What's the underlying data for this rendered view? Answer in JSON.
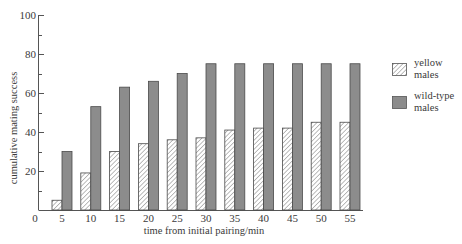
{
  "chart_data": {
    "type": "bar",
    "title": "",
    "xlabel": "time from initial pairing/min",
    "ylabel": "cumulative mating success",
    "categories": [
      "5",
      "10",
      "15",
      "20",
      "25",
      "30",
      "35",
      "40",
      "45",
      "50",
      "55"
    ],
    "series": [
      {
        "name": "yellow males",
        "pattern": "hatched",
        "values": [
          5,
          19,
          30,
          34,
          36,
          37,
          41,
          42,
          42,
          45,
          45
        ]
      },
      {
        "name": "wild-type males",
        "pattern": "solid-gray",
        "values": [
          30,
          53,
          63,
          66,
          70,
          75,
          75,
          75,
          75,
          75,
          75
        ]
      }
    ],
    "ylim": [
      0,
      100
    ],
    "yticks": [
      0,
      20,
      40,
      60,
      80,
      100
    ],
    "grid": false,
    "legend_position": "right"
  },
  "axes": {
    "x_origin_label": "0",
    "y_tick_labels": [
      "20",
      "40",
      "60",
      "80",
      "100"
    ]
  },
  "legend": [
    {
      "line1": "yellow",
      "line2": "males"
    },
    {
      "line1": "wild-type",
      "line2": "males"
    }
  ],
  "colors": {
    "wild_type_fill": "#8c8c8c",
    "bar_outline": "#4a4a4a",
    "hatch": "#6e6e6e",
    "axis": "#555555"
  }
}
